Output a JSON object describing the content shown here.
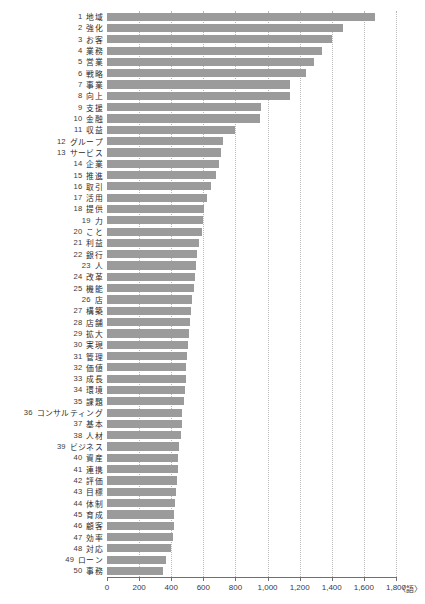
{
  "chart_data": {
    "type": "bar",
    "orientation": "horizontal",
    "title": "",
    "xlabel": "",
    "ylabel": "",
    "unit_label": "〈語〉",
    "xlim": [
      0,
      1800
    ],
    "grid": true,
    "grid_axis": "x",
    "legend": false,
    "bar_color": "#9b9b9b",
    "axis_color": "#6f6f6f",
    "tick_labels": [
      "0",
      "200",
      "400",
      "600",
      "800",
      "1,000",
      "1,200",
      "1,400",
      "1,600",
      "1,800"
    ],
    "tick_values": [
      0,
      200,
      400,
      600,
      800,
      1000,
      1200,
      1400,
      1600,
      1800
    ],
    "categories": [
      "地域",
      "強化",
      "お客",
      "業務",
      "営業",
      "戦略",
      "事業",
      "向上",
      "支援",
      "金融",
      "収益",
      "グループ",
      "サービス",
      "企業",
      "推進",
      "取引",
      "活用",
      "提供",
      "力",
      "こと",
      "利益",
      "銀行",
      "人",
      "改革",
      "機能",
      "店",
      "構築",
      "店舗",
      "拡大",
      "実現",
      "管理",
      "価値",
      "成長",
      "環境",
      "課題",
      "コンサルティング",
      "基本",
      "人材",
      "ビジネス",
      "資産",
      "連携",
      "評価",
      "目標",
      "体制",
      "育成",
      "顧客",
      "効率",
      "対応",
      "ローン",
      "事務"
    ],
    "ranks": [
      1,
      2,
      3,
      4,
      5,
      6,
      7,
      8,
      9,
      10,
      11,
      12,
      13,
      14,
      15,
      16,
      17,
      18,
      19,
      20,
      21,
      22,
      23,
      24,
      25,
      26,
      27,
      28,
      29,
      30,
      31,
      32,
      33,
      34,
      35,
      36,
      37,
      38,
      39,
      40,
      41,
      42,
      43,
      44,
      45,
      46,
      47,
      48,
      49,
      50
    ],
    "values": [
      1670,
      1470,
      1400,
      1340,
      1290,
      1240,
      1140,
      1140,
      960,
      950,
      800,
      720,
      710,
      700,
      680,
      645,
      620,
      605,
      600,
      590,
      570,
      560,
      555,
      545,
      540,
      530,
      525,
      520,
      510,
      505,
      500,
      495,
      490,
      485,
      480,
      470,
      465,
      460,
      450,
      445,
      440,
      435,
      430,
      425,
      420,
      415,
      410,
      400,
      370,
      350
    ]
  },
  "corner": {
    "mark": ""
  }
}
